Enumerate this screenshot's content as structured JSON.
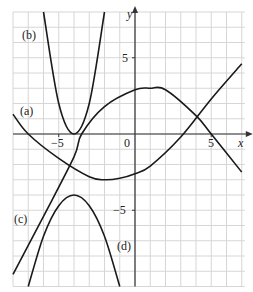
{
  "figure": {
    "axis_labels": {
      "x": "x",
      "y": "y"
    },
    "tick_labels": {
      "x_neg5": "−5",
      "x_0": "0",
      "x_5": "5",
      "y_5": "5",
      "y_neg5": "−5"
    },
    "curve_labels": {
      "a": "(a)",
      "b": "(b)",
      "c": "(c)",
      "d": "(d)"
    },
    "colors": {
      "grid": "#d6d6d6",
      "axis": "#333333",
      "curve": "#1a1a1a"
    }
  },
  "chart_data": {
    "type": "line",
    "title": "",
    "xlabel": "x",
    "ylabel": "y",
    "xlim": [
      -8,
      7.2
    ],
    "ylim": [
      -10,
      8
    ],
    "grid": true,
    "legend": "none (curves labelled inline)",
    "x_ticks": [
      -5,
      0,
      5
    ],
    "y_ticks": [
      5,
      -5
    ],
    "series": [
      {
        "name": "(a)",
        "description": "upward parabola, minimum near (-2,-3)",
        "x": [
          -8,
          -7,
          -5,
          -3,
          -2,
          -1,
          0,
          1,
          3,
          5,
          7
        ],
        "y": [
          1.3,
          0,
          -1.6,
          -2.8,
          -3,
          -2.9,
          -2.6,
          -2.1,
          -0.2,
          2.3,
          4.6
        ]
      },
      {
        "name": "(b)",
        "description": "steep upward parabola, vertex (-4,0)",
        "x": [
          -6,
          -5,
          -4,
          -3,
          -2
        ],
        "y": [
          8,
          2,
          0,
          2,
          8
        ]
      },
      {
        "name": "(c)",
        "description": "downward parabola, max near (1,3)",
        "x": [
          -8,
          -6,
          -4,
          -3.5,
          -2,
          0,
          1,
          2,
          4,
          5,
          7
        ],
        "y": [
          -9.2,
          -5.4,
          -1.5,
          0,
          1.8,
          2.9,
          3,
          2.9,
          1.2,
          0,
          -2.5
        ]
      },
      {
        "name": "(d)",
        "description": "downward parabola, vertex (-4,-4)",
        "x": [
          -7,
          -6,
          -5,
          -4,
          -3,
          -2,
          -1
        ],
        "y": [
          -10,
          -6.7,
          -4.7,
          -4,
          -4.7,
          -6.7,
          -10
        ]
      }
    ]
  }
}
